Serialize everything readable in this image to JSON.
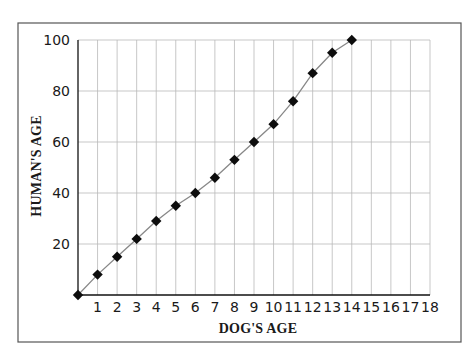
{
  "chart_data": {
    "type": "line",
    "title": "",
    "xlabel": "DOG'S AGE",
    "ylabel": "HUMAN'S AGE",
    "x": [
      0,
      1,
      2,
      3,
      4,
      5,
      6,
      7,
      8,
      9,
      10,
      11,
      12,
      13,
      14
    ],
    "series": [
      {
        "name": "Human's age",
        "values": [
          0,
          8,
          15,
          22,
          29,
          35,
          40,
          46,
          53,
          60,
          67,
          76,
          87,
          95,
          100
        ],
        "marker": "diamond",
        "line_color": "#888888",
        "marker_color": "#0d0d0d"
      }
    ],
    "xlim": [
      0,
      18
    ],
    "ylim": [
      0,
      100
    ],
    "xticks": [
      1,
      2,
      3,
      4,
      5,
      6,
      7,
      8,
      9,
      10,
      11,
      12,
      13,
      14,
      15,
      16,
      17,
      18
    ],
    "yticks": [
      20,
      40,
      60,
      80,
      100
    ],
    "grid": true,
    "legend": "none"
  }
}
